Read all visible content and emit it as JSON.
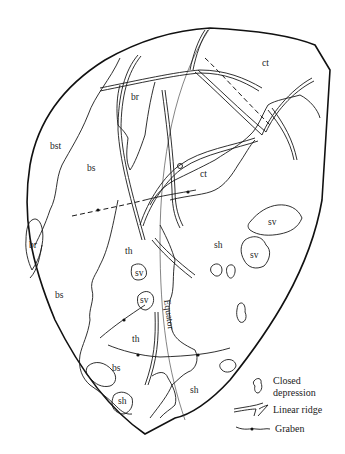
{
  "map": {
    "region_labels": [
      {
        "id": "ct-north",
        "text": "ct",
        "x": 262,
        "y": 66
      },
      {
        "id": "br-north",
        "text": "br",
        "x": 131,
        "y": 100
      },
      {
        "id": "bst",
        "text": "bst",
        "x": 50,
        "y": 149
      },
      {
        "id": "bs-upper",
        "text": "bs",
        "x": 87,
        "y": 171
      },
      {
        "id": "ct-central",
        "text": "ct",
        "x": 200,
        "y": 177
      },
      {
        "id": "br-west",
        "text": "br",
        "x": 29,
        "y": 248
      },
      {
        "id": "sv-east-1",
        "text": "sv",
        "x": 268,
        "y": 225
      },
      {
        "id": "th-upper",
        "text": "th",
        "x": 125,
        "y": 254
      },
      {
        "id": "sh-central",
        "text": "sh",
        "x": 214,
        "y": 248
      },
      {
        "id": "sv-east-2",
        "text": "sv",
        "x": 250,
        "y": 258
      },
      {
        "id": "sv-center",
        "text": "sv",
        "x": 137,
        "y": 275
      },
      {
        "id": "bs-lower",
        "text": "bs",
        "x": 55,
        "y": 298
      },
      {
        "id": "sv-south",
        "text": "sv",
        "x": 140,
        "y": 303
      },
      {
        "id": "th-lower",
        "text": "th",
        "x": 132,
        "y": 342
      },
      {
        "id": "bs-small",
        "text": "bs",
        "x": 112,
        "y": 371
      },
      {
        "id": "sh-south",
        "text": "sh",
        "x": 190,
        "y": 393
      },
      {
        "id": "sh-small",
        "text": "sh",
        "x": 118,
        "y": 404
      }
    ],
    "equator_label": "Equator"
  },
  "legend": {
    "items": [
      {
        "symbol": "closed-depression",
        "label_line1": "Closed",
        "label_line2": "depression"
      },
      {
        "symbol": "linear-ridge",
        "label_line1": "Linear ridge",
        "label_line2": ""
      },
      {
        "symbol": "graben",
        "label_line1": "Graben",
        "label_line2": ""
      }
    ]
  }
}
